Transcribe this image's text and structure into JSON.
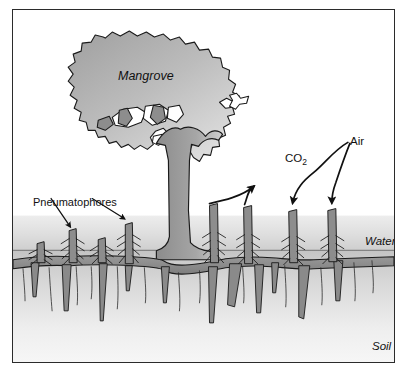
{
  "figure": {
    "kind": "scientific-diagram",
    "border_color": "#2b2b2b",
    "background_color": "#ffffff"
  },
  "labels": {
    "mangrove": "Mangrove",
    "pneumatophores": "Pneumatophores",
    "co2": "CO",
    "co2_subscript": "2",
    "air": "Air",
    "water": "Water",
    "soil": "Soil"
  },
  "zones": {
    "air_zone": {
      "name": "air",
      "fill": "#ffffff",
      "top": 0,
      "bottom": 213
    },
    "water_zone": {
      "name": "water",
      "fill_top": "#e9e9e9",
      "fill_bottom": "#d2d2d2",
      "top": 213,
      "bottom": 239
    },
    "soil_zone": {
      "name": "soil",
      "fill_top": "#c9c9c9",
      "fill_bottom": "#f2f2f2",
      "top": 239,
      "bottom": 354
    }
  },
  "colors": {
    "tree_fill_dark": "#8f8f8f",
    "tree_fill_light": "#d8d8d8",
    "canopy_fill_dark": "#a8a8a8",
    "canopy_fill_light": "#e2e2e2",
    "root_fill": "#8a8a8a",
    "outline": "#1a1a1a",
    "arrow": "#111111",
    "waterline": "#6e6e6e"
  },
  "arrows": {
    "pneumatophore_pointers": [
      {
        "name": "pneumatophore-arrow-left",
        "from": [
          55,
          200
        ],
        "to": [
          71,
          227
        ],
        "direction": "down-right"
      },
      {
        "name": "pneumatophore-arrow-right",
        "from": [
          95,
          200
        ],
        "to": [
          127,
          222
        ],
        "direction": "down-right"
      }
    ],
    "co2_outflow": [
      {
        "name": "co2-curve-left",
        "from": [
          211,
          205
        ],
        "to": [
          268,
          166
        ],
        "direction": "up-right"
      },
      {
        "name": "co2-curve-right",
        "from": [
          245,
          207
        ],
        "to": [
          268,
          166
        ],
        "direction": "up-left"
      }
    ],
    "air_inflow": [
      {
        "name": "air-curve-left",
        "from": [
          343,
          139
        ],
        "to": [
          290,
          211
        ],
        "direction": "down-left"
      },
      {
        "name": "air-curve-right",
        "from": [
          345,
          140
        ],
        "to": [
          329,
          210
        ],
        "direction": "down"
      }
    ]
  },
  "pneumatophores": [
    {
      "name": "pneumatophore-1",
      "x": 38,
      "top": 238,
      "emergent": false
    },
    {
      "name": "pneumatophore-2",
      "x": 71,
      "top": 227,
      "emergent": true
    },
    {
      "name": "pneumatophore-3",
      "x": 100,
      "top": 235,
      "emergent": false
    },
    {
      "name": "pneumatophore-4",
      "x": 127,
      "top": 222,
      "emergent": true
    },
    {
      "name": "pneumatophore-5",
      "x": 211,
      "top": 205,
      "emergent": true
    },
    {
      "name": "pneumatophore-6",
      "x": 245,
      "top": 207,
      "emergent": true
    },
    {
      "name": "pneumatophore-7",
      "x": 290,
      "top": 211,
      "emergent": true
    },
    {
      "name": "pneumatophore-8",
      "x": 329,
      "top": 210,
      "emergent": true
    }
  ],
  "trunk": {
    "name": "mangrove-trunk",
    "x_left": 155,
    "x_right": 180,
    "top": 138,
    "bottom": 255
  }
}
